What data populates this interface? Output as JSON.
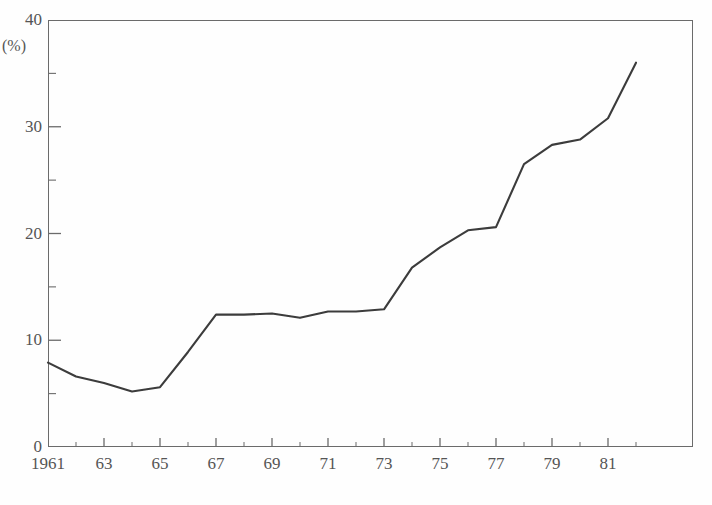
{
  "chart_data": {
    "type": "line",
    "title": "",
    "xlabel": "",
    "ylabel": "(%)",
    "unit_label": "(%)",
    "xlim": [
      1961,
      1982
    ],
    "ylim": [
      0,
      40
    ],
    "y_ticks_major": [
      0,
      10,
      20,
      30,
      40
    ],
    "y_ticks_minor": [
      5,
      15,
      25,
      35
    ],
    "y_tick_labels": [
      "0",
      "10",
      "20",
      "30",
      "40"
    ],
    "x_tick_labels": [
      "1961",
      "63",
      "65",
      "67",
      "69",
      "71",
      "73",
      "75",
      "77",
      "79",
      "81"
    ],
    "x_tick_years": [
      1961,
      1963,
      1965,
      1967,
      1969,
      1971,
      1973,
      1975,
      1977,
      1979,
      1981
    ],
    "x_minor_years": [
      1962,
      1964,
      1966,
      1968,
      1970,
      1972,
      1974,
      1976,
      1978,
      1980,
      1982
    ],
    "grid": false,
    "legend": "none",
    "line_color": "#3c3c3c",
    "axis_color": "#6b6b6b",
    "x": [
      1961,
      1962,
      1963,
      1964,
      1965,
      1966,
      1967,
      1968,
      1969,
      1970,
      1971,
      1972,
      1973,
      1974,
      1975,
      1976,
      1977,
      1978,
      1979,
      1980,
      1981,
      1982
    ],
    "values": [
      7.9,
      6.6,
      6.0,
      5.2,
      5.6,
      8.9,
      12.4,
      12.4,
      12.5,
      12.1,
      12.7,
      12.7,
      12.9,
      16.8,
      18.7,
      20.3,
      20.6,
      26.5,
      28.3,
      28.8,
      30.8,
      36.0
    ],
    "series": [
      {
        "name": "series-1",
        "values": [
          7.9,
          6.6,
          6.0,
          5.2,
          5.6,
          8.9,
          12.4,
          12.4,
          12.5,
          12.1,
          12.7,
          12.7,
          12.9,
          16.8,
          18.7,
          20.3,
          20.6,
          26.5,
          28.3,
          28.8,
          30.8,
          36.0
        ]
      }
    ]
  },
  "caption": {
    "text": ""
  }
}
